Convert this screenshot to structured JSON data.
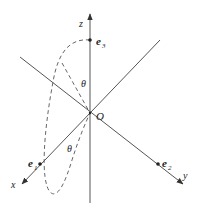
{
  "diagram": {
    "type": "3d-coordinate-axes",
    "colors": {
      "axis": "#555555",
      "dashed": "#555555",
      "text": "#222222"
    },
    "axes": {
      "x": {
        "label": "x"
      },
      "y": {
        "label": "y"
      },
      "z": {
        "label": "z"
      }
    },
    "origin": {
      "label": "O"
    },
    "vectors": [
      {
        "name": "e1",
        "label": "e",
        "subscript": "1"
      },
      {
        "name": "e2",
        "label": "e",
        "subscript": "2"
      },
      {
        "name": "e3",
        "label": "e",
        "subscript": "3"
      }
    ],
    "angles": [
      {
        "label": "θ"
      },
      {
        "label": "θ"
      }
    ]
  }
}
